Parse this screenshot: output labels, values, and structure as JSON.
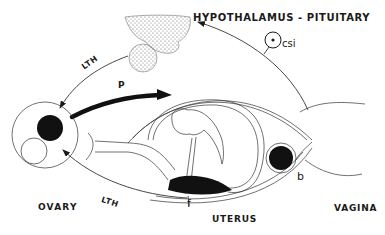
{
  "title": "HYPOTHALAMUS - PITUITARY",
  "labels": {
    "ovary": "OVARY",
    "uterus": "UTERUS",
    "vagina": "VAGINA",
    "csi": "csi",
    "p": "P",
    "b": "b",
    "f": "f",
    "lth_upper": "LTH",
    "lth_lower": "LTH"
  },
  "colors": {
    "ink": "#1a1a1a",
    "stipple": "#555555",
    "background": "#ffffff"
  }
}
